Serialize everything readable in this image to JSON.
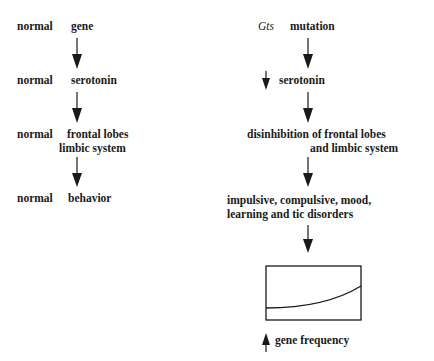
{
  "left_pathway": {
    "step1": {
      "qualifier": "normal",
      "label": "gene"
    },
    "step2": {
      "qualifier": "normal",
      "label": "serotonin"
    },
    "step3": {
      "qualifier": "normal",
      "label_line1": "frontal lobes",
      "label_line2": "limbic system"
    },
    "step4": {
      "qualifier": "normal",
      "label": "behavior"
    }
  },
  "right_pathway": {
    "step1": {
      "qualifier": "Gts",
      "label": "mutation"
    },
    "step2": {
      "qualifier_icon": "down-arrow-icon",
      "label": "serotonin"
    },
    "step3": {
      "label_line1": "disinhibition of frontal lobes",
      "label_line2": "and limbic system"
    },
    "step4": {
      "label_line1": "impulsive, compulsive, mood,",
      "label_line2": "learning and tic disorders"
    },
    "graph": {
      "description": "rising curve in box"
    },
    "step5": {
      "qualifier_icon": "up-arrow-icon",
      "label": "gene frequency"
    }
  },
  "colors": {
    "ink": "#1a1a1a",
    "background": "#ffffff"
  }
}
